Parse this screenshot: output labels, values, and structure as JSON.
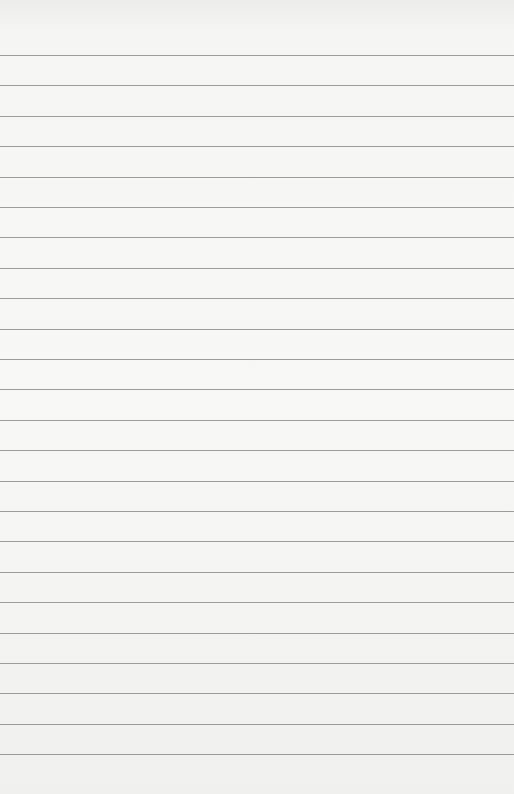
{
  "paper": {
    "type": "lined-paper",
    "line_count": 24,
    "first_line_y": 55,
    "line_spacing": 30.4,
    "background_color": "#f3f3f1",
    "line_color": "#8c8c8c"
  }
}
